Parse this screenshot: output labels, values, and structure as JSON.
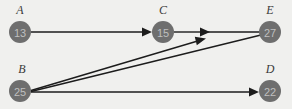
{
  "figure": {
    "background_color": "#f0f0ee",
    "width": 292,
    "height": 109
  },
  "style": {
    "node_fill": "#6e6e6e",
    "node_value_color": "#bfbfbf",
    "node_label_color": "#3a3a3a",
    "edge_color": "#1c1c1c",
    "node_radius": 11
  },
  "graph": {
    "nodes": [
      {
        "id": "A",
        "label": "A",
        "value": "13",
        "cx": 20,
        "cy": 32,
        "label_x": 20,
        "label_y": 14
      },
      {
        "id": "C",
        "label": "C",
        "value": "15",
        "cx": 163,
        "cy": 32,
        "label_x": 163,
        "label_y": 14
      },
      {
        "id": "E",
        "label": "E",
        "value": "27",
        "cx": 270,
        "cy": 32,
        "label_x": 270,
        "label_y": 14
      },
      {
        "id": "B",
        "label": "B",
        "value": "25",
        "cx": 20,
        "cy": 91,
        "label_x": 22,
        "label_y": 73
      },
      {
        "id": "D",
        "label": "D",
        "value": "22",
        "cx": 270,
        "cy": 91,
        "label_x": 270,
        "label_y": 73
      }
    ],
    "edges": [
      {
        "from": "A",
        "to": "C",
        "directed": true,
        "x1": 31,
        "y1": 32,
        "x2": 150,
        "y2": 32
      },
      {
        "from": "C",
        "to": "E",
        "directed": true,
        "x1": 174,
        "y1": 32,
        "x2": 259,
        "y2": 32
      },
      {
        "from": "B",
        "to": "E",
        "directed": true,
        "x1": 31,
        "y1": 90,
        "x2": 260,
        "y2": 36
      },
      {
        "from": "B",
        "to": "D",
        "directed": true,
        "x1": 31,
        "y1": 92,
        "x2": 258,
        "y2": 92
      }
    ]
  }
}
